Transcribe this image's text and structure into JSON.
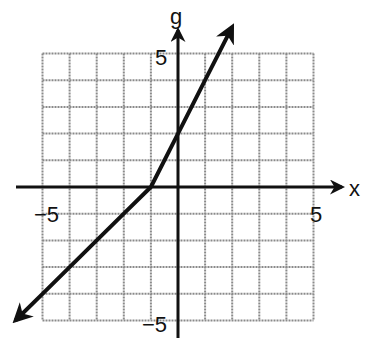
{
  "chart_data": {
    "type": "line",
    "title": "",
    "xlabel": "x",
    "ylabel": "g",
    "xlim": [
      -5,
      5
    ],
    "ylim": [
      -5,
      5
    ],
    "grid": true,
    "grid_step": 1,
    "tick_labels": {
      "x": [
        {
          "value": -5,
          "label": "−5"
        },
        {
          "value": 5,
          "label": "5"
        }
      ],
      "y": [
        {
          "value": 5,
          "label": "5"
        },
        {
          "value": -5,
          "label": "−5"
        }
      ]
    },
    "series": [
      {
        "name": "g",
        "description": "piecewise linear, vertex at (-1, 0); g(x)=x+1 for x<-1, g(x)=2x+2 for x>=-1; arrows at both ends",
        "x": [
          -6,
          -5,
          -4,
          -3,
          -2,
          -1,
          0,
          1,
          2
        ],
        "y": [
          -5,
          -4,
          -3,
          -2,
          -1,
          0,
          2,
          4,
          6
        ]
      }
    ],
    "colors": {
      "grid": "#8a8a8a",
      "axis": "#111111",
      "curve": "#111111"
    }
  }
}
